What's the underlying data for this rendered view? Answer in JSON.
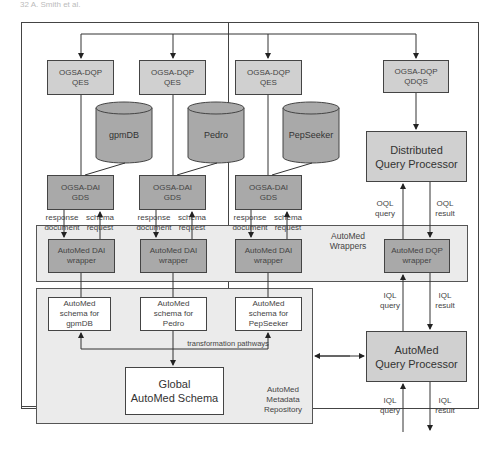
{
  "page_header": "32    A. Smith et al.",
  "qes_nodes": [
    {
      "label": "OGSA-DQP\nQES"
    },
    {
      "label": "OGSA-DQP\nQES"
    },
    {
      "label": "OGSA-DQP\nQES"
    }
  ],
  "qdqs_node": {
    "label": "OGSA-DQP\nQDQS"
  },
  "databases": [
    {
      "label": "gpmDB"
    },
    {
      "label": "Pedro"
    },
    {
      "label": "PepSeeker"
    }
  ],
  "gds_nodes": [
    {
      "label": "OGSA-DAI\nGDS"
    },
    {
      "label": "OGSA-DAI\nGDS"
    },
    {
      "label": "OGSA-DAI\nGDS"
    }
  ],
  "gds_edge_labels": [
    {
      "left": "response\ndocument",
      "right": "schema\nrequest"
    },
    {
      "left": "response\ndocument",
      "right": "schema\nrequest"
    },
    {
      "left": "response\ndocument",
      "right": "schema\nrequest"
    }
  ],
  "wrappers_region": {
    "label": "AutoMed\nWrappers"
  },
  "dai_wrappers": [
    {
      "label": "AutoMed DAI\nwrapper"
    },
    {
      "label": "AutoMed DAI\nwrapper"
    },
    {
      "label": "AutoMed DAI\nwrapper"
    }
  ],
  "dqp_wrapper": {
    "label": "AutoMed DQP\nwrapper"
  },
  "distributed_query_processor": {
    "label": "Distributed\nQuery Processor"
  },
  "oql_labels": {
    "query": "OQL\nquery",
    "result": "OQL\nresult"
  },
  "iql_labels_upper": {
    "query": "IQL\nquery",
    "result": "IQL\nresult"
  },
  "iql_labels_lower": {
    "query": "IQL\nquery",
    "result": "IQL\nresult"
  },
  "metadata_region": {
    "label": "AutoMed\nMetadata\nRepository"
  },
  "schemas": [
    {
      "label": "AutoMed\nschema for\ngpmDB"
    },
    {
      "label": "AutoMed\nschema for\nPedro"
    },
    {
      "label": "AutoMed\nschema for\nPepSeeker"
    }
  ],
  "transformation_label": "transformation pathways",
  "global_schema": {
    "label": "Global\nAutoMed Schema"
  },
  "automed_query_processor": {
    "label": "AutoMed\nQuery Processor"
  },
  "colors": {
    "light_box": "#d0d0d0",
    "mid_box": "#a9a9a9",
    "region": "#ebebeb",
    "line": "#333333"
  }
}
